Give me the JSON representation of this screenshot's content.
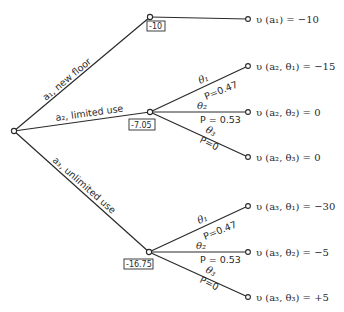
{
  "root": {
    "x": 14,
    "y": 131
  },
  "actions": [
    {
      "id": "a1",
      "label": "a1, new floor",
      "symbol": "a",
      "subscript": "1",
      "name": "new floor",
      "node": {
        "x": 150,
        "y": 17
      },
      "expected_value": "-10",
      "leaves": [
        {
          "x": 248,
          "y": 19,
          "utility": "u(a1) = -10",
          "display": "υ (a₁) = −10"
        }
      ]
    },
    {
      "id": "a2",
      "label": "a2, limited use",
      "symbol": "a",
      "subscript": "2",
      "name": "limited use",
      "node": {
        "x": 150,
        "y": 112
      },
      "expected_value": "-7.05",
      "branches": [
        {
          "state": "θ1",
          "state_display": "θ₁",
          "probability": "P = 0.47",
          "leaf": {
            "x": 248,
            "y": 66
          },
          "utility": "u(a2, θ1) = -15",
          "display": "υ (a₂, θ₁) = −15"
        },
        {
          "state": "θ2",
          "state_display": "θ₂",
          "probability": "P = 0.53",
          "leaf": {
            "x": 248,
            "y": 112
          },
          "utility": "u(a2, θ2) = 0",
          "display": "υ (a₂, θ₂) = 0"
        },
        {
          "state": "θ3",
          "state_display": "θ₃",
          "probability": "P = 0",
          "leaf": {
            "x": 248,
            "y": 157
          },
          "utility": "u(a2, θ3) = 0",
          "display": "υ (a₂, θ₃) = 0"
        }
      ]
    },
    {
      "id": "a3",
      "label": "a3, unlimited use",
      "symbol": "a",
      "subscript": "3",
      "name": "unlimited use",
      "node": {
        "x": 149,
        "y": 252
      },
      "expected_value": "-16.75",
      "branches": [
        {
          "state": "θ1",
          "state_display": "θ₁",
          "probability": "P = 0.47",
          "leaf": {
            "x": 248,
            "y": 206
          },
          "utility": "u(a3, θ1) = -30",
          "display": "υ (a₃, θ₁) = −30"
        },
        {
          "state": "θ2",
          "state_display": "θ₂",
          "probability": "P = 0.53",
          "leaf": {
            "x": 248,
            "y": 252
          },
          "utility": "u(a3, θ2) = -5",
          "display": "υ (a₃, θ₂) = −5"
        },
        {
          "state": "θ3",
          "state_display": "θ₃",
          "probability": "P = 0",
          "leaf": {
            "x": 248,
            "y": 297
          },
          "utility": "u(a3, θ3) = +5",
          "display": "υ (a₃, θ₃) = +5"
        }
      ]
    }
  ],
  "text": {
    "a1_label": "a₁, new floor",
    "a2_label": "a₂, limited use",
    "a3_label": "a₃, unlimited use",
    "ev_a1": "-10",
    "ev_a2": "-7.05",
    "ev_a3": "-16.75",
    "u_a1": "υ (a₁) = −10",
    "u_a2_t1": "υ (a₂, θ₁) = −15",
    "u_a2_t2": "υ (a₂, θ₂) = 0",
    "u_a2_t3": "υ (a₂, θ₃) = 0",
    "u_a3_t1": "υ (a₃, θ₁) = −30",
    "u_a3_t2": "υ (a₃, θ₂) = −5",
    "u_a3_t3": "υ (a₃, θ₃) = +5",
    "theta1": "θ₁",
    "theta2": "θ₂",
    "theta3": "θ₃",
    "p1": "P = 0.47",
    "p2": "P = 0.53",
    "p3": "P = 0",
    "p1_compact": "P=0.47",
    "p2_compact": "P = 0.53",
    "p3_compact": "P=0"
  }
}
